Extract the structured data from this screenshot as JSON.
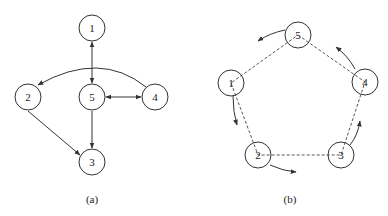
{
  "figure_a": {
    "caption": "(a)",
    "nodes": [
      {
        "id": "1",
        "label": "1",
        "x": 92,
        "y": 28
      },
      {
        "id": "2",
        "label": "2",
        "x": 28,
        "y": 97
      },
      {
        "id": "3",
        "label": "3",
        "x": 92,
        "y": 162
      },
      {
        "id": "4",
        "label": "4",
        "x": 155,
        "y": 97
      },
      {
        "id": "5",
        "label": "5",
        "x": 92,
        "y": 97
      }
    ],
    "edges": [
      {
        "from": "1",
        "to": "5",
        "type": "bidirectional"
      },
      {
        "from": "5",
        "to": "4",
        "type": "bidirectional"
      },
      {
        "from": "4",
        "to": "2",
        "type": "directed-curved"
      },
      {
        "from": "5",
        "to": "3",
        "type": "directed"
      },
      {
        "from": "2",
        "to": "3",
        "type": "directed"
      }
    ]
  },
  "figure_b": {
    "caption": "(b)",
    "nodes": [
      {
        "id": "1",
        "label": "1",
        "x": 231,
        "y": 83
      },
      {
        "id": "2",
        "label": "2",
        "x": 258,
        "y": 155
      },
      {
        "id": "3",
        "label": "3",
        "x": 341,
        "y": 155
      },
      {
        "id": "4",
        "label": "4",
        "x": 365,
        "y": 82
      },
      {
        "id": "5",
        "label": "5",
        "x": 298,
        "y": 35
      }
    ],
    "dashed_cycle": [
      "5",
      "4",
      "3",
      "2",
      "1",
      "5"
    ],
    "rotation_arrows": "counter-clockwise arrows beside each node"
  }
}
